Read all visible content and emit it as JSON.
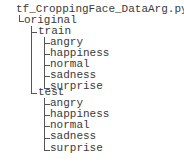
{
  "root": {
    "label": "tf_CroppingFace_DataArg.py",
    "children": [
      {
        "label": "original",
        "children": [
          {
            "label": "train",
            "children": [
              "angry",
              "happiness",
              "normal",
              "sadness",
              "surprise"
            ]
          },
          {
            "label": "test",
            "children": [
              "angry",
              "happiness",
              "normal",
              "sadness",
              "surprise"
            ]
          }
        ]
      }
    ]
  }
}
